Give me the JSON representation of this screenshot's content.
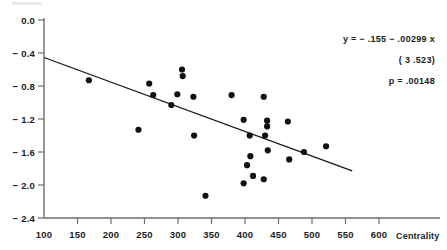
{
  "chart_data": {
    "type": "scatter",
    "title": "",
    "xlabel": "Centrality",
    "ylabel": "",
    "xlim": [
      100,
      620
    ],
    "ylim": [
      -2.4,
      0.0
    ],
    "grid": false,
    "legend": "none",
    "x_ticks": [
      100,
      150,
      200,
      250,
      300,
      350,
      400,
      450,
      500,
      550,
      600
    ],
    "x_tick_labels": [
      "100",
      "150",
      "200",
      "250",
      "300",
      "350",
      "400",
      "450",
      "500",
      "550",
      "600"
    ],
    "y_ticks": [
      0.0,
      -0.4,
      -0.8,
      -1.2,
      -1.6,
      -2.0,
      -2.4
    ],
    "y_tick_labels": [
      "0.0",
      "− 0.4",
      "− 0.8",
      "− 1.2",
      "− 1.6",
      "− 2.0",
      "− 2.4"
    ],
    "marker": "filled-circle",
    "marker_color": "#111111",
    "points": [
      {
        "x": 167,
        "y": -0.73
      },
      {
        "x": 241,
        "y": -1.33
      },
      {
        "x": 257,
        "y": -0.77
      },
      {
        "x": 263,
        "y": -0.91
      },
      {
        "x": 290,
        "y": -1.03
      },
      {
        "x": 299,
        "y": -0.9
      },
      {
        "x": 306,
        "y": -0.6
      },
      {
        "x": 307,
        "y": -0.68
      },
      {
        "x": 323,
        "y": -0.93
      },
      {
        "x": 324,
        "y": -1.4
      },
      {
        "x": 341,
        "y": -2.13
      },
      {
        "x": 380,
        "y": -0.91
      },
      {
        "x": 398,
        "y": -1.21
      },
      {
        "x": 398,
        "y": -1.98
      },
      {
        "x": 403,
        "y": -1.76
      },
      {
        "x": 407,
        "y": -1.4
      },
      {
        "x": 408,
        "y": -1.65
      },
      {
        "x": 412,
        "y": -1.89
      },
      {
        "x": 428,
        "y": -0.93
      },
      {
        "x": 428,
        "y": -1.93
      },
      {
        "x": 430,
        "y": -1.4
      },
      {
        "x": 433,
        "y": -1.22
      },
      {
        "x": 433,
        "y": -1.29
      },
      {
        "x": 434,
        "y": -1.58
      },
      {
        "x": 464,
        "y": -1.23
      },
      {
        "x": 466,
        "y": -1.69
      },
      {
        "x": 488,
        "y": -1.6
      },
      {
        "x": 521,
        "y": -1.53
      }
    ],
    "regression_line": {
      "equation": "y = − .155 − .00299 x",
      "slope": -0.00299,
      "intercept": -0.155,
      "x_start": 100,
      "x_end": 560,
      "y_start": -0.454,
      "y_end": -1.829
    },
    "annotations": {
      "equation": "y = − .155 − .00299 x",
      "statistic": "( 3 .523)",
      "pvalue": "p = .00148"
    }
  }
}
